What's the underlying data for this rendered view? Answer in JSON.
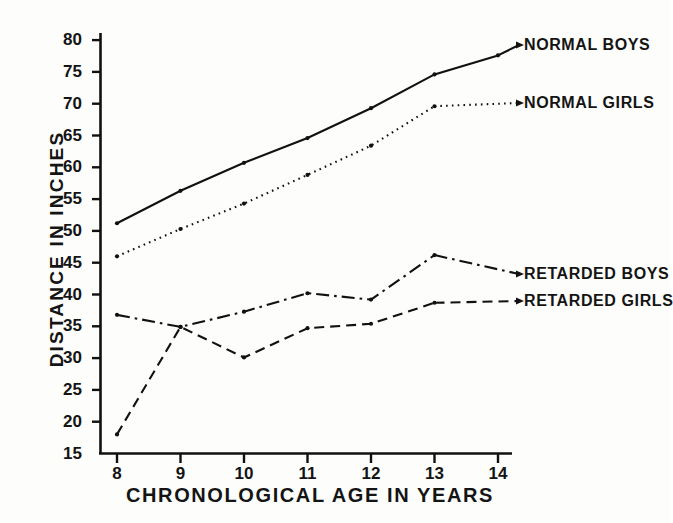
{
  "chart_data": {
    "type": "line",
    "title": "",
    "xlabel": "CHRONOLOGICAL  AGE  IN  YEARS",
    "ylabel": "DISTANCE  IN  INCHES",
    "x": [
      8,
      9,
      10,
      11,
      12,
      13,
      14
    ],
    "xticklabels": [
      "8",
      "9",
      "10",
      "11",
      "12",
      "13",
      "14"
    ],
    "xlim": [
      7.7,
      14.4
    ],
    "ylim": [
      15,
      82
    ],
    "yticks": [
      15,
      20,
      25,
      30,
      35,
      40,
      45,
      50,
      55,
      60,
      65,
      70,
      75,
      80
    ],
    "yticklabels": [
      "15",
      "20",
      "25",
      "30",
      "35",
      "40",
      "45",
      "50",
      "55",
      "60",
      "65",
      "70",
      "75",
      "80"
    ],
    "grid": false,
    "legend_position": "inline-right-annotations",
    "series": [
      {
        "name": "NORMAL BOYS",
        "linestyle": "solid",
        "color": "#111111",
        "x": [
          8,
          9,
          10,
          11,
          12,
          13,
          14
        ],
        "values": [
          51.2,
          56.3,
          60.7,
          64.6,
          69.3,
          74.6,
          77.6
        ]
      },
      {
        "name": "NORMAL GIRLS",
        "linestyle": "dotted",
        "color": "#111111",
        "x": [
          8,
          9,
          10,
          11,
          12,
          13
        ],
        "values": [
          46.0,
          50.3,
          54.3,
          58.8,
          63.4,
          69.6
        ]
      },
      {
        "name": "RETARDED BOYS",
        "linestyle": "dashdot",
        "color": "#111111",
        "x": [
          8,
          9,
          10,
          11,
          12,
          13
        ],
        "values": [
          36.8,
          34.9,
          37.3,
          40.2,
          39.2,
          46.2
        ]
      },
      {
        "name": "RETARDED GIRLS",
        "linestyle": "dashed",
        "color": "#111111",
        "x": [
          8,
          9,
          10,
          11,
          12,
          13
        ],
        "values": [
          18.0,
          34.9,
          30.1,
          34.7,
          35.4,
          38.7
        ]
      }
    ],
    "annotations": [
      {
        "text": "NORMAL BOYS",
        "series": "NORMAL BOYS"
      },
      {
        "text": "NORMAL GIRLS",
        "series": "NORMAL GIRLS"
      },
      {
        "text": "RETARDED BOYS",
        "series": "RETARDED BOYS"
      },
      {
        "text": "RETARDED GIRLS",
        "series": "RETARDED GIRLS"
      }
    ]
  }
}
